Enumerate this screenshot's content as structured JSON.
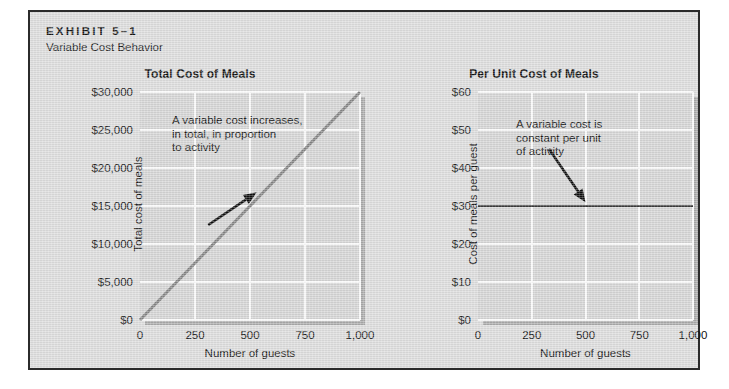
{
  "exhibit": {
    "kicker": "EXHIBIT 5–1",
    "subtitle": "Variable Cost Behavior",
    "frame_color": "#2b2b2b",
    "background_color": "#dcdcdc"
  },
  "chart_data": [
    {
      "id": "total-cost-of-meals",
      "type": "line",
      "title": "Total Cost of Meals",
      "xlabel": "Number of guests",
      "ylabel": "Total cost of meals",
      "xlim": [
        0,
        1000
      ],
      "ylim": [
        0,
        30000
      ],
      "xticks": [
        0,
        250,
        500,
        750,
        1000
      ],
      "xtick_labels": [
        "0",
        "250",
        "500",
        "750",
        "1,000"
      ],
      "yticks": [
        0,
        5000,
        10000,
        15000,
        20000,
        25000,
        30000
      ],
      "ytick_labels": [
        "$0",
        "$5,000",
        "$10,000",
        "$15,000",
        "$20,000",
        "$25,000",
        "$30,000"
      ],
      "grid": true,
      "legend": "none",
      "series": [
        {
          "name": "Total cost of meals",
          "color": "#848484",
          "linewidth": 3,
          "x": [
            0,
            250,
            500,
            750,
            1000
          ],
          "values": [
            0,
            7500,
            15000,
            22500,
            30000
          ]
        }
      ],
      "annotation": {
        "text": "A variable cost increases,\nin total, in proportion\nto activity",
        "arrow_from": [
          310,
          12500
        ],
        "arrow_to": [
          530,
          16800
        ],
        "arrow_color": "#0d0d0d"
      }
    },
    {
      "id": "per-unit-cost-of-meals",
      "type": "line",
      "title": "Per Unit Cost of Meals",
      "xlabel": "Number of guests",
      "ylabel": "Cost of meals per guest",
      "xlim": [
        0,
        1000
      ],
      "ylim": [
        0,
        60
      ],
      "xticks": [
        0,
        250,
        500,
        750,
        1000
      ],
      "xtick_labels": [
        "0",
        "250",
        "500",
        "750",
        "1,000"
      ],
      "yticks": [
        0,
        10,
        20,
        30,
        40,
        50,
        60
      ],
      "ytick_labels": [
        "$0",
        "$10",
        "$20",
        "$30",
        "$40",
        "$50",
        "$60"
      ],
      "grid": true,
      "legend": "none",
      "series": [
        {
          "name": "Cost of meals per guest",
          "color": "#3a3a3a",
          "linewidth": 2,
          "x": [
            0,
            250,
            500,
            750,
            1000
          ],
          "values": [
            30,
            30,
            30,
            30,
            30
          ]
        }
      ],
      "annotation": {
        "text": "A variable cost is\nconstant per unit\nof activity",
        "arrow_from": [
          330,
          45
        ],
        "arrow_to": [
          500,
          31
        ],
        "arrow_color": "#0d0d0d"
      }
    }
  ]
}
